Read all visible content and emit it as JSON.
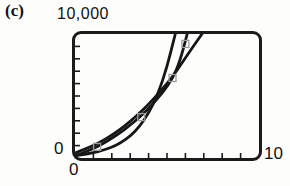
{
  "figure": {
    "panel_label": "(c)",
    "y_axis_max_label": "10,000",
    "y_axis_min_label": "0",
    "x_axis_min_label": "0",
    "x_axis_max_label": "10"
  },
  "colors": {
    "curve": "#161616",
    "marker": "#9b9b9b",
    "tick": "#1b1b1b",
    "window_border": "#1b1b1b",
    "text": "#111111",
    "background": "#fdfdfc"
  },
  "chart_data": {
    "type": "scatter",
    "title": "",
    "xlabel": "",
    "ylabel": "",
    "xlim": [
      0,
      10
    ],
    "ylim": [
      0,
      10000
    ],
    "grid": false,
    "legend": "none",
    "x_ticks": [
      1,
      2,
      3,
      4,
      5,
      6,
      7,
      8,
      9
    ],
    "y_ticks": [
      1000,
      2000,
      3000,
      4000,
      5000,
      6000,
      7000,
      8000,
      9000
    ],
    "points": [
      [
        1.2,
        900
      ],
      [
        3.6,
        3300
      ],
      [
        5.3,
        6450
      ],
      [
        6.0,
        9200
      ]
    ],
    "series": [
      {
        "name": "fit-curve-shallow",
        "points": [
          [
            0,
            400
          ],
          [
            0.6,
            750
          ],
          [
            1.2,
            1150
          ],
          [
            1.8,
            1650
          ],
          [
            2.4,
            2250
          ],
          [
            3.0,
            2950
          ],
          [
            3.6,
            3750
          ],
          [
            4.2,
            4650
          ],
          [
            4.8,
            5650
          ],
          [
            5.3,
            6550
          ],
          [
            5.9,
            7850
          ],
          [
            6.4,
            8950
          ],
          [
            6.9,
            10000
          ]
        ]
      },
      {
        "name": "fit-curve-middle",
        "points": [
          [
            0,
            150
          ],
          [
            0.6,
            500
          ],
          [
            1.2,
            900
          ],
          [
            1.8,
            1400
          ],
          [
            2.4,
            1980
          ],
          [
            3.0,
            2650
          ],
          [
            3.6,
            3400
          ],
          [
            4.2,
            4300
          ],
          [
            4.8,
            5350
          ],
          [
            5.3,
            6400
          ],
          [
            5.7,
            7800
          ],
          [
            6.1,
            10000
          ]
        ]
      },
      {
        "name": "fit-curve-steep",
        "points": [
          [
            0,
            210
          ],
          [
            0.5,
            300
          ],
          [
            1.0,
            430
          ],
          [
            1.5,
            610
          ],
          [
            2.0,
            870
          ],
          [
            2.5,
            1240
          ],
          [
            3.0,
            1770
          ],
          [
            3.5,
            2520
          ],
          [
            4.0,
            3610
          ],
          [
            4.5,
            5130
          ],
          [
            5.0,
            7310
          ],
          [
            5.45,
            10000
          ]
        ]
      }
    ]
  }
}
